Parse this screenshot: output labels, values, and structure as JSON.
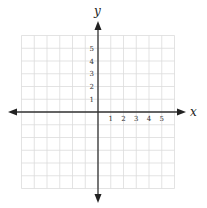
{
  "chart_data": {
    "type": "coordinate-grid",
    "title": "",
    "xlabel": "x",
    "ylabel": "y",
    "x_tick_labels": [
      "1",
      "2",
      "3",
      "4",
      "5"
    ],
    "y_tick_labels": [
      "1",
      "2",
      "3",
      "4",
      "5"
    ],
    "xlim": [
      -6,
      6
    ],
    "ylim": [
      -6,
      6
    ],
    "grid": true,
    "axis_arrows": true,
    "series": []
  },
  "colors": {
    "grid": "#dcdcdc",
    "axis": "#333333",
    "text": "#333333"
  },
  "labels": {
    "x_axis": "x",
    "y_axis": "y"
  }
}
